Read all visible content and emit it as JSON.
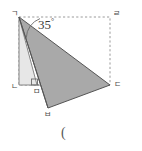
{
  "figure": {
    "type": "geometry-diagram",
    "canvas": {
      "width": 142,
      "height": 151
    },
    "colors": {
      "background": "#ffffff",
      "triangle_light_fill": "#e7e7e7",
      "triangle_dark_fill": "#a9a9a9",
      "stroke": "#4d4d4d",
      "dashed_stroke": "#9a9a9a",
      "label_color": "#4a4a4a",
      "angle_text_color": "#3a3a3a"
    },
    "angle": {
      "value": "35",
      "degree_symbol": "°",
      "at_vertex": "ㄱ"
    },
    "vertices": [
      {
        "id": "g",
        "label": "ㄱ",
        "x": 19,
        "y": 17,
        "label_x": 11,
        "label_y": 11
      },
      {
        "id": "r",
        "label": "ㄹ",
        "x": 110,
        "y": 17,
        "label_x": 113,
        "label_y": 11
      },
      {
        "id": "n",
        "label": "ㄴ",
        "x": 19,
        "y": 85,
        "label_x": 11,
        "label_y": 84
      },
      {
        "id": "m",
        "label": "ㅁ",
        "x": 37,
        "y": 85,
        "label_x": 33,
        "label_y": 87
      },
      {
        "id": "d",
        "label": "ㄷ",
        "x": 110,
        "y": 85,
        "label_x": 114,
        "label_y": 82
      },
      {
        "id": "b",
        "label": "ㅂ",
        "x": 48,
        "y": 108,
        "label_x": 44,
        "label_y": 110
      }
    ],
    "shapes": {
      "dashed_rect": {
        "x": 19,
        "y": 17,
        "width": 91,
        "height": 68
      },
      "light_triangle_points": "19,17 19,85 37,85",
      "dark_triangle_points": "19,17 110,85 48,108",
      "dashed_diagonal": "37,85 110,85"
    },
    "caption": {
      "text": "(",
      "x": 61,
      "y": 129
    }
  }
}
